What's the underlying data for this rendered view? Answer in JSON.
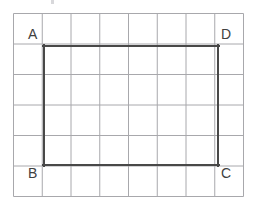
{
  "figure": {
    "kind": "geometry-grid-figure",
    "background_color": "#ffffff",
    "grid": {
      "columns": 8,
      "rows": 6,
      "left": 13,
      "top": 13,
      "right": 243,
      "bottom": 196,
      "cell_width": 28.75,
      "cell_height": 30.5,
      "line_color": "#a8a8ac",
      "line_width": 1,
      "border_color": "#a8a8ac"
    },
    "shape": {
      "name": "rectangle",
      "vertex_order": "A-B-C-D",
      "stroke_color": "#484848",
      "stroke_width": 2,
      "fill": "none",
      "left": 44,
      "top": 46,
      "right": 218,
      "bottom": 165,
      "width_cells": 6,
      "height_cells": 4
    },
    "labels": [
      {
        "id": "A",
        "text": "A",
        "x": 28,
        "y": 27,
        "corner": "top-left"
      },
      {
        "id": "D",
        "text": "D",
        "x": 221,
        "y": 27,
        "corner": "top-right"
      },
      {
        "id": "B",
        "text": "B",
        "x": 28,
        "y": 166,
        "corner": "bottom-left"
      },
      {
        "id": "C",
        "text": "C",
        "x": 221,
        "y": 166,
        "corner": "bottom-right"
      }
    ],
    "label_color": "#404040",
    "label_font_size": 14
  }
}
